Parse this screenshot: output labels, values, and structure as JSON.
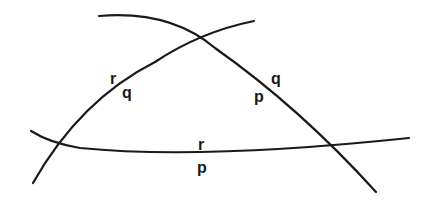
{
  "diagram": {
    "stroke_color": "#1a1a1a",
    "background": "#ffffff",
    "curves": [
      {
        "id": "curve-upper-left-to-lower-right",
        "path": "M 99 16 Q 170 10 215 48 Q 300 108 376 192"
      },
      {
        "id": "curve-lower-left-to-upper-right",
        "path": "M 33 183 Q 80 100 155 62 Q 200 32 254 21"
      },
      {
        "id": "curve-horizontal",
        "path": "M 31 131 Q 50 143 80 148 Q 200 160 409 138"
      }
    ],
    "labels": [
      {
        "id": "left-side-r",
        "text": "r",
        "x": 110,
        "y": 84
      },
      {
        "id": "left-side-q",
        "text": "q",
        "x": 122,
        "y": 98
      },
      {
        "id": "right-side-q",
        "text": "q",
        "x": 271,
        "y": 84
      },
      {
        "id": "right-side-p",
        "text": "p",
        "x": 254,
        "y": 102
      },
      {
        "id": "bottom-side-r",
        "text": "r",
        "x": 198,
        "y": 150
      },
      {
        "id": "bottom-side-p",
        "text": "p",
        "x": 197,
        "y": 173
      }
    ]
  }
}
